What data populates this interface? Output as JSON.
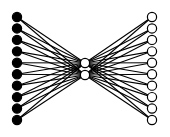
{
  "diagram": {
    "type": "autoencoder-network",
    "background": "#ffffff",
    "edge_color": "#000000",
    "layers": [
      {
        "name": "input",
        "node_count": 10,
        "x": 17,
        "y_start": 17,
        "y_end": 120,
        "fill": "#000000",
        "stroke": "#000000",
        "radius": 4.6
      },
      {
        "name": "bottleneck",
        "node_count": 2,
        "x": 85,
        "y_start": 63,
        "y_end": 75,
        "fill": "#ffffff",
        "stroke": "#000000",
        "radius": 4.6
      },
      {
        "name": "output",
        "node_count": 10,
        "x": 152,
        "y_start": 17,
        "y_end": 120,
        "fill": "#ffffff",
        "stroke": "#000000",
        "radius": 4.6
      }
    ],
    "connections": "fully-connected-adjacent-layers"
  }
}
